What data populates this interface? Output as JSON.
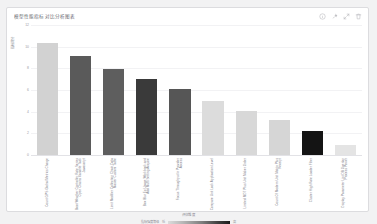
{
  "card": {
    "title": "模型性能指标对比分析图表",
    "tools": [
      {
        "name": "info-icon",
        "glyph": "info"
      },
      {
        "name": "pin-icon",
        "glyph": "pin"
      },
      {
        "name": "expand-icon",
        "glyph": "expand"
      },
      {
        "name": "delete-icon",
        "glyph": "trash"
      }
    ]
  },
  "chart_data": {
    "type": "bar",
    "title": "模型性能指标对比分析图表",
    "xlabel": "评估维度",
    "ylabel": "指标得分",
    "ylim": [
      0,
      12
    ],
    "yticks": [
      0,
      2,
      4,
      6,
      8,
      10,
      12
    ],
    "grid": true,
    "legend_position": "bottom",
    "categories": [
      "Count GPS Global Metrics Charge",
      "Boot Weather Controller Rate Series Open Chains Variable Task Javascript",
      "Limit Modifier Collection Chain Data Master Custom Table",
      "Box Blur Ex Usage Workbook and Add Multi Setting Acquire",
      "Focus Throughput In Provider Access",
      "Compare Unit Lock Application Level",
      "Limited MDT Plus Unit Maker Order",
      "Count Of Modern Unit Matrix Plus Receipt",
      "Cluster High Rate Loader Filter",
      "Display Parameter List DB Overlap Process Power"
    ],
    "values": [
      10.3,
      9.1,
      7.9,
      7.0,
      6.1,
      5.0,
      4.1,
      3.2,
      2.2,
      0.9
    ],
    "bar_colors": [
      "#d2d2d2",
      "#5a5a5a",
      "#5e5e5e",
      "#3a3a3a",
      "#565656",
      "#dcdcdc",
      "#d8d8d8",
      "#d6d6d6",
      "#141414",
      "#e4e4e4"
    ],
    "colorbar": {
      "label": "指标强度等级",
      "min_label": "低",
      "max_label": "高",
      "gradient_from": "#dcdcdc",
      "gradient_to": "#1a1a1a"
    }
  },
  "colors": {
    "card_background": "#ffffff",
    "card_border": "#dcdcdf",
    "page_background": "#f2f2f3",
    "grid": "#f2f2f4",
    "axis": "#e2e2e6",
    "text_muted": "#8e8e96"
  }
}
